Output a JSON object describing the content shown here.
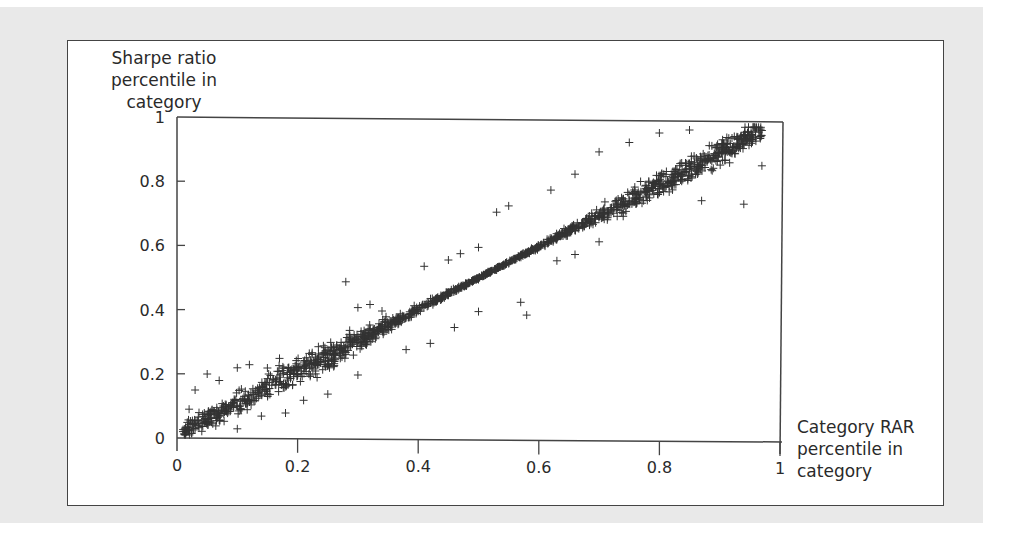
{
  "chart_data": {
    "type": "scatter",
    "title": "",
    "xlabel": "Category RAR percentile in category",
    "ylabel": "Sharpe ratio percentile in category",
    "xlim": [
      0,
      1
    ],
    "ylim": [
      0,
      1
    ],
    "xticks": [
      "0",
      "0.2",
      "0.4",
      "0.6",
      "0.8",
      "1"
    ],
    "yticks": [
      "0",
      "0.2",
      "0.4",
      "0.6",
      "0.8",
      "1"
    ],
    "grid": false,
    "legend": null,
    "marker": "+",
    "marker_color": "#333333",
    "trend": {
      "description": "Dense band along y ≈ x",
      "slope": 0.99,
      "intercept": 0.01,
      "band_halfwidth": 0.03
    },
    "series": [
      {
        "name": "funds",
        "points": [
          [
            0.01,
            0.02
          ],
          [
            0.03,
            0.03
          ],
          [
            0.05,
            0.05
          ],
          [
            0.07,
            0.07
          ],
          [
            0.1,
            0.1
          ],
          [
            0.12,
            0.12
          ],
          [
            0.15,
            0.14
          ],
          [
            0.18,
            0.17
          ],
          [
            0.2,
            0.2
          ],
          [
            0.22,
            0.22
          ],
          [
            0.25,
            0.25
          ],
          [
            0.28,
            0.27
          ],
          [
            0.3,
            0.3
          ],
          [
            0.33,
            0.33
          ],
          [
            0.35,
            0.35
          ],
          [
            0.38,
            0.38
          ],
          [
            0.4,
            0.4
          ],
          [
            0.43,
            0.43
          ],
          [
            0.45,
            0.45
          ],
          [
            0.48,
            0.48
          ],
          [
            0.5,
            0.5
          ],
          [
            0.53,
            0.53
          ],
          [
            0.55,
            0.55
          ],
          [
            0.58,
            0.58
          ],
          [
            0.6,
            0.6
          ],
          [
            0.63,
            0.63
          ],
          [
            0.65,
            0.65
          ],
          [
            0.68,
            0.68
          ],
          [
            0.7,
            0.7
          ],
          [
            0.73,
            0.73
          ],
          [
            0.75,
            0.75
          ],
          [
            0.78,
            0.78
          ],
          [
            0.8,
            0.8
          ],
          [
            0.83,
            0.83
          ],
          [
            0.85,
            0.85
          ],
          [
            0.88,
            0.88
          ],
          [
            0.9,
            0.9
          ],
          [
            0.93,
            0.93
          ],
          [
            0.95,
            0.95
          ],
          [
            0.97,
            0.97
          ],
          [
            0.02,
            0.09
          ],
          [
            0.03,
            0.15
          ],
          [
            0.05,
            0.2
          ],
          [
            0.07,
            0.18
          ],
          [
            0.1,
            0.22
          ],
          [
            0.12,
            0.23
          ],
          [
            0.15,
            0.22
          ],
          [
            0.17,
            0.25
          ],
          [
            0.28,
            0.49
          ],
          [
            0.3,
            0.41
          ],
          [
            0.32,
            0.42
          ],
          [
            0.34,
            0.4
          ],
          [
            0.36,
            0.37
          ],
          [
            0.41,
            0.54
          ],
          [
            0.45,
            0.56
          ],
          [
            0.47,
            0.58
          ],
          [
            0.5,
            0.6
          ],
          [
            0.53,
            0.71
          ],
          [
            0.55,
            0.73
          ],
          [
            0.62,
            0.78
          ],
          [
            0.66,
            0.83
          ],
          [
            0.7,
            0.9
          ],
          [
            0.75,
            0.93
          ],
          [
            0.8,
            0.96
          ],
          [
            0.85,
            0.97
          ],
          [
            0.63,
            0.56
          ],
          [
            0.66,
            0.58
          ],
          [
            0.7,
            0.62
          ],
          [
            0.74,
            0.7
          ],
          [
            0.78,
            0.75
          ],
          [
            0.87,
            0.75
          ],
          [
            0.94,
            0.74
          ],
          [
            0.97,
            0.86
          ],
          [
            0.57,
            0.43
          ],
          [
            0.58,
            0.39
          ],
          [
            0.5,
            0.4
          ],
          [
            0.46,
            0.35
          ],
          [
            0.42,
            0.3
          ],
          [
            0.38,
            0.28
          ],
          [
            0.3,
            0.2
          ],
          [
            0.25,
            0.14
          ],
          [
            0.21,
            0.12
          ],
          [
            0.18,
            0.08
          ],
          [
            0.14,
            0.07
          ],
          [
            0.1,
            0.03
          ]
        ]
      }
    ]
  },
  "axes": {
    "ylabel_line1": "Sharpe ratio",
    "ylabel_line2": "percentile in category",
    "xlabel_line1": "Category RAR",
    "xlabel_line2": "percentile in",
    "xlabel_line3": "category"
  }
}
